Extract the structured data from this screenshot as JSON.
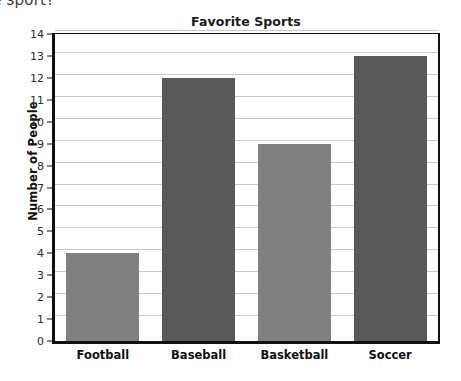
{
  "page": {
    "clipped_question_text": "orite sport?"
  },
  "chart_data": {
    "type": "bar",
    "title": "Favorite Sports",
    "xlabel": "",
    "ylabel": "Number of People",
    "categories": [
      "Football",
      "Baseball",
      "Basketball",
      "Soccer"
    ],
    "values": [
      4,
      12,
      9,
      13
    ],
    "bar_colors": [
      "#808080",
      "#595959",
      "#808080",
      "#595959"
    ],
    "ylim": [
      0,
      14
    ],
    "ytick_labels": [
      "0",
      "1",
      "2",
      "3",
      "4",
      "5",
      "6",
      "7",
      "8",
      "9",
      "10",
      "11",
      "12",
      "13",
      "14"
    ],
    "ytick_values": [
      0,
      1,
      2,
      3,
      4,
      5,
      6,
      7,
      8,
      9,
      10,
      11,
      12,
      13,
      14
    ],
    "grid": true,
    "grid_axis": "y",
    "grid_color": "#c9c9c9",
    "legend": false,
    "plot_background": "#ffffff",
    "axis_color": "#111111"
  }
}
